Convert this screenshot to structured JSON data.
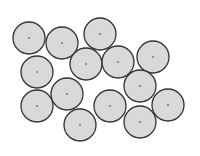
{
  "diagram": {
    "width": 200,
    "height": 156,
    "colors": {
      "background": "#ffffff",
      "circle_fill": "#d9d9d9",
      "circle_stroke": "#333333",
      "center_dot": "#333333"
    },
    "radius": 16,
    "circles": [
      {
        "id": 1,
        "cx": 29,
        "cy": 38
      },
      {
        "id": 2,
        "cx": 62,
        "cy": 43
      },
      {
        "id": 3,
        "cx": 100,
        "cy": 34
      },
      {
        "id": 4,
        "cx": 37,
        "cy": 72
      },
      {
        "id": 5,
        "cx": 86,
        "cy": 64
      },
      {
        "id": 6,
        "cx": 118,
        "cy": 62
      },
      {
        "id": 7,
        "cx": 153,
        "cy": 57
      },
      {
        "id": 8,
        "cx": 140,
        "cy": 86
      },
      {
        "id": 9,
        "cx": 37,
        "cy": 106
      },
      {
        "id": 10,
        "cx": 67,
        "cy": 94
      },
      {
        "id": 11,
        "cx": 110,
        "cy": 106
      },
      {
        "id": 12,
        "cx": 168,
        "cy": 105
      },
      {
        "id": 13,
        "cx": 80,
        "cy": 125
      },
      {
        "id": 14,
        "cx": 140,
        "cy": 122
      }
    ]
  }
}
